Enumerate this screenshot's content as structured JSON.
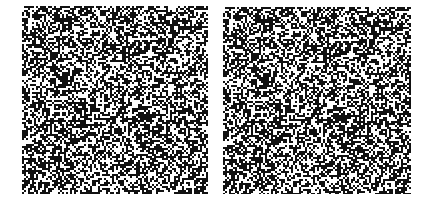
{
  "figure": {
    "type": "random-dot-stereogram",
    "caption": "",
    "panels": [
      {
        "name": "left",
        "x": 22,
        "y": 6,
        "width": 186,
        "height": 188
      },
      {
        "name": "right",
        "x": 223,
        "y": 7,
        "width": 188,
        "height": 187
      }
    ],
    "dot_size": 2,
    "density": 0.55,
    "seed": 1337,
    "disparity_region": {
      "x0": 0.3,
      "y0": 0.3,
      "x1": 0.7,
      "y1": 0.7,
      "shift": 3
    },
    "colors": {
      "dot": "#111111",
      "background": "#ffffff"
    }
  }
}
